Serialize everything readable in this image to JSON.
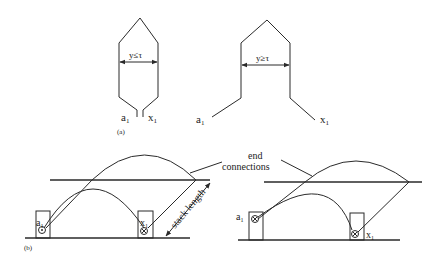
{
  "figure": {
    "part_a": {
      "label": "(a)",
      "left_coil": {
        "span_label": "y≤τ",
        "terminal_start": "a",
        "terminal_start_sub": "1",
        "terminal_end": "x",
        "terminal_end_sub": "1"
      },
      "right_coil": {
        "span_label": "y≥τ",
        "terminal_start": "a",
        "terminal_start_sub": "1",
        "terminal_end": "x",
        "terminal_end_sub": "1"
      }
    },
    "part_b": {
      "label": "(b)",
      "annotation_end_connections_line1": "end",
      "annotation_end_connections_line2": "connections",
      "dimension_label": "stack length",
      "left_panel": {
        "slot_start": "a",
        "slot_start_sub": "1",
        "slot_end": "x",
        "slot_end_sub": "1"
      },
      "right_panel": {
        "slot_start": "a",
        "slot_start_sub": "1",
        "slot_end": "x",
        "slot_end_sub": "1"
      }
    },
    "colors": {
      "stroke": "#2a2a2a",
      "background": "#ffffff"
    }
  }
}
